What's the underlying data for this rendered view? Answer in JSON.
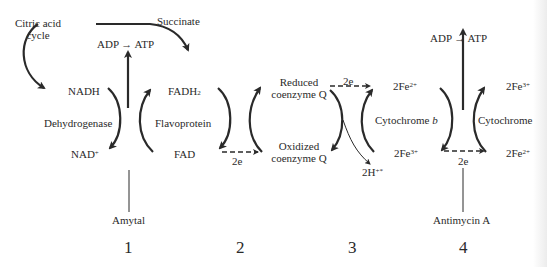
{
  "diagram": {
    "inputs": {
      "citric_acid_cycle": "Citric acid\ncycle",
      "citric_line1": "Citric acid",
      "citric_line2": "cycle",
      "succinate": "Succinate"
    },
    "phosphorylation": [
      {
        "label": "ADP → ATP",
        "site": 1
      },
      {
        "label": "ADP → ATP",
        "site": 4
      }
    ],
    "complexes": [
      {
        "name": "Dehydrogenase",
        "reduced": "NADH",
        "oxidized_base": "NAD",
        "oxidized_sup": "+"
      },
      {
        "name": "Flavoprotein",
        "reduced_base": "FADH",
        "reduced_sub": "2",
        "oxidized": "FAD"
      },
      {
        "name_line1": "Reduced",
        "name_line2": "coenzyme Q",
        "oxidized_line1": "Oxidized",
        "oxidized_line2": "coenzyme Q"
      },
      {
        "name_base": "Cytochrome ",
        "name_italic": "b",
        "top_base": "2Fe",
        "top_sup": "2+",
        "bottom_base": "2Fe",
        "bottom_sup": "3+"
      },
      {
        "name": "Cytochrome",
        "top_base": "2Fe",
        "top_sup": "3+",
        "bottom_base": "2Fe",
        "bottom_sup": "2+"
      }
    ],
    "electron_labels": [
      "2e",
      "2e",
      "2e"
    ],
    "proton_label_base": "2H",
    "proton_label_sup": "+*",
    "inhibitors": [
      "Amytal",
      "Antimycin A"
    ],
    "site_numbers": [
      "1",
      "2",
      "3",
      "4"
    ],
    "colors": {
      "ink": "#2a2a2a",
      "background": "#ffffff"
    }
  }
}
